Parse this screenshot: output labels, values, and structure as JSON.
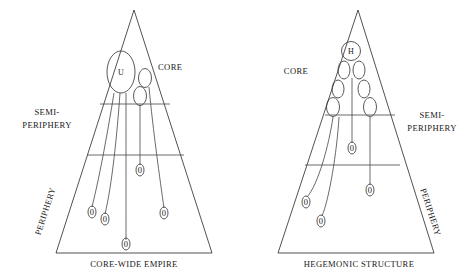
{
  "figure": {
    "title_visible": false,
    "background_color": "#ffffff",
    "line_color": "#333333",
    "text_color": "#202020"
  },
  "diagrams": [
    {
      "id": "core-wide-empire",
      "base_label": "CORE-WIDE EMPIRE",
      "zone_labels": {
        "core": "CORE",
        "semiperiphery": "SEMI-\nPERIPHERY",
        "semiperiphery_line1": "SEMI-",
        "semiperiphery_line2": "PERIPHERY",
        "periphery": "PERIPHERY"
      },
      "central_node_label": "U",
      "small_node_label": "0",
      "small_node_count": 5
    },
    {
      "id": "hegemonic-structure",
      "base_label": "HEGEMONIC STRUCTURE",
      "zone_labels": {
        "core": "CORE",
        "semiperiphery": "SEMI-\nPERIPHERY",
        "semiperiphery_line1": "SEMI-",
        "semiperiphery_line2": "PERIPHERY",
        "periphery": "PERIPHERY"
      },
      "central_node_label": "H",
      "small_node_label": "0",
      "small_node_count": 4,
      "core_oval_count": 6
    }
  ],
  "nodes": {
    "left": {
      "main": "U",
      "zeros": [
        "0",
        "0",
        "0",
        "0",
        "0"
      ]
    },
    "right": {
      "main": "H",
      "zeros": [
        "0",
        "0",
        "0",
        "0"
      ]
    }
  }
}
